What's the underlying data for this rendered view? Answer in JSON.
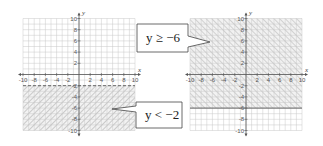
{
  "chart_data": [
    {
      "type": "inequality-graph",
      "title": "",
      "inequality": "y < -2",
      "boundary": {
        "y": -2,
        "style": "dashed"
      },
      "shaded_region": "below",
      "xlabel": "x",
      "ylabel": "y",
      "xlim": [
        -10,
        10
      ],
      "ylim": [
        -10,
        10
      ],
      "x_ticks": [
        "-10",
        "-8",
        "-6",
        "-4",
        "-2",
        "2",
        "4",
        "6",
        "8",
        "10"
      ],
      "y_ticks": [
        "10",
        "8",
        "6",
        "4",
        "2",
        "-2",
        "-4",
        "-6",
        "-8",
        "-10"
      ],
      "grid": true,
      "callout": {
        "label": "y < −2",
        "points_to": [
          6,
          -5.5
        ]
      }
    },
    {
      "type": "inequality-graph",
      "title": "",
      "inequality": "y ≥ -6",
      "boundary": {
        "y": -6,
        "style": "solid"
      },
      "shaded_region": "above",
      "xlabel": "x",
      "ylabel": "y",
      "xlim": [
        -10,
        10
      ],
      "ylim": [
        -10,
        10
      ],
      "x_ticks": [
        "-10",
        "-8",
        "-6",
        "-4",
        "-2",
        "2",
        "4",
        "6",
        "8",
        "10"
      ],
      "y_ticks": [
        "10",
        "8",
        "6",
        "4",
        "2",
        "-2",
        "-4",
        "-6",
        "-8",
        "-10"
      ],
      "grid": true,
      "callout": {
        "label": "y ≥ −6",
        "points_to": [
          -6,
          5
        ]
      }
    }
  ],
  "callouts": {
    "left_label": "y < −2",
    "right_label": "y ≥ −6"
  },
  "axes": {
    "x_label": "x",
    "y_label": "y"
  },
  "colors": {
    "grid": "#c8c8c8",
    "axis": "#555555",
    "hatch": "#9a9a9a",
    "boundary": "#666666"
  }
}
